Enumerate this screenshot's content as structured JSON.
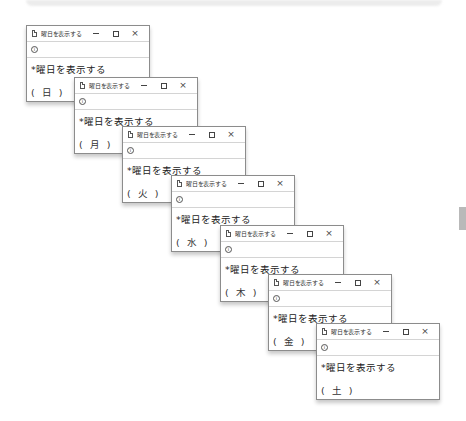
{
  "windows": [
    {
      "title": "曜日を表示する",
      "address_icon": "info-icon",
      "heading": "*曜日を表示する",
      "day": "( 日 )",
      "x": 26,
      "y": 25
    },
    {
      "title": "曜日を表示する",
      "address_icon": "info-icon",
      "heading": "*曜日を表示する",
      "day": "( 月 )",
      "x": 74,
      "y": 77
    },
    {
      "title": "曜日を表示する",
      "address_icon": "info-icon",
      "heading": "*曜日を表示する",
      "day": "( 火 )",
      "x": 122,
      "y": 126
    },
    {
      "title": "曜日を表示する",
      "address_icon": "info-icon",
      "heading": "*曜日を表示する",
      "day": "( 水 )",
      "x": 171,
      "y": 175
    },
    {
      "title": "曜日を表示する",
      "address_icon": "info-icon",
      "heading": "*曜日を表示する",
      "day": "( 木 )",
      "x": 220,
      "y": 225
    },
    {
      "title": "曜日を表示する",
      "address_icon": "info-icon",
      "heading": "*曜日を表示する",
      "day": "( 金 )",
      "x": 268,
      "y": 274
    },
    {
      "title": "曜日を表示する",
      "address_icon": "info-icon",
      "heading": "*曜日を表示する",
      "day": "( 土 )",
      "x": 316,
      "y": 323
    }
  ],
  "controls": {
    "minimize": "minimize-icon",
    "maximize": "maximize-icon",
    "close": "×"
  },
  "colors": {
    "window_border": "#8c8c8c",
    "divider": "#d4d4d4",
    "side_block": "#b9b9b9"
  }
}
